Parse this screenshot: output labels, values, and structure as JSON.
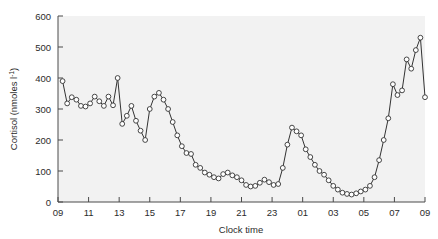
{
  "chart_data": {
    "type": "line",
    "title": "",
    "xlabel": "Clock time",
    "ylabel": "Cortisol (nmoles l",
    "ylabel_sup": "-1",
    "ylabel_close": ")",
    "xlim": [
      9,
      33
    ],
    "ylim": [
      0,
      600
    ],
    "grid": false,
    "legend": "none",
    "marker": "open-circle",
    "line_color": "#333333",
    "marker_face": "#ffffff",
    "plot_bg": "#f2f2f2",
    "x_tick_labels": [
      "09",
      "11",
      "13",
      "15",
      "17",
      "19",
      "21",
      "23",
      "01",
      "03",
      "05",
      "07",
      "09"
    ],
    "x_tick_values": [
      9,
      11,
      13,
      15,
      17,
      19,
      21,
      23,
      25,
      27,
      29,
      31,
      33
    ],
    "y_tick_labels": [
      "0",
      "100",
      "200",
      "300",
      "400",
      "500",
      "600"
    ],
    "y_tick_values": [
      0,
      100,
      200,
      300,
      400,
      500,
      600
    ],
    "series": [
      {
        "name": "Cortisol",
        "x": [
          9.3,
          9.6,
          9.9,
          10.2,
          10.5,
          10.8,
          11.1,
          11.4,
          11.7,
          12.0,
          12.3,
          12.6,
          12.9,
          13.2,
          13.5,
          13.8,
          14.1,
          14.4,
          14.7,
          15.0,
          15.3,
          15.6,
          15.9,
          16.2,
          16.5,
          16.8,
          17.1,
          17.4,
          17.7,
          18.0,
          18.3,
          18.6,
          18.9,
          19.2,
          19.5,
          19.8,
          20.1,
          20.4,
          20.7,
          21.0,
          21.3,
          21.6,
          21.9,
          22.2,
          22.5,
          22.8,
          23.1,
          23.4,
          23.7,
          24.0,
          24.3,
          24.6,
          24.9,
          25.2,
          25.5,
          25.8,
          26.1,
          26.4,
          26.7,
          27.0,
          27.3,
          27.6,
          27.9,
          28.2,
          28.5,
          28.8,
          29.1,
          29.4,
          29.7,
          30.0,
          30.3,
          30.6,
          30.9,
          31.2,
          31.5,
          31.8,
          32.1,
          32.4,
          32.7,
          33.0
        ],
        "y": [
          390,
          318,
          338,
          330,
          310,
          308,
          318,
          340,
          325,
          310,
          340,
          312,
          400,
          252,
          278,
          310,
          262,
          230,
          200,
          300,
          340,
          352,
          330,
          300,
          258,
          215,
          180,
          158,
          155,
          120,
          110,
          95,
          88,
          80,
          76,
          90,
          95,
          86,
          80,
          70,
          55,
          50,
          52,
          62,
          72,
          64,
          55,
          58,
          110,
          185,
          240,
          228,
          215,
          170,
          145,
          120,
          100,
          88,
          70,
          52,
          40,
          30,
          26,
          24,
          28,
          34,
          40,
          52,
          80,
          135,
          200,
          270,
          380,
          345,
          360,
          460,
          430,
          490,
          530,
          338
        ]
      }
    ]
  },
  "axes": {
    "y_label_text": "Cortisol (nmoles l",
    "x_label_text": "Clock time"
  }
}
